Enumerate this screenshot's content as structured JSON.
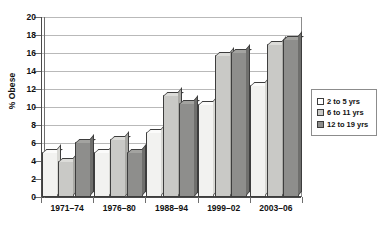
{
  "chart_data": {
    "type": "bar",
    "title": "",
    "xlabel": "",
    "ylabel": "% Obese",
    "ylim": [
      0,
      20
    ],
    "ytick_step": 2,
    "yticks": [
      "20",
      "18",
      "16",
      "14",
      "12",
      "10",
      "8",
      "6",
      "4",
      "2",
      "0"
    ],
    "grid": true,
    "legend_position": "right",
    "categories": [
      "1971–74",
      "1976–80",
      "1988–94",
      "1999–02",
      "2003–06"
    ],
    "series": [
      {
        "name": "2 to 5 yrs",
        "color": "#f2f2f0",
        "values": [
          5.0,
          5.0,
          7.2,
          10.3,
          12.4
        ]
      },
      {
        "name": "6 to 11 yrs",
        "color": "#c9c9c6",
        "values": [
          4.0,
          6.5,
          11.3,
          15.8,
          17.0
        ]
      },
      {
        "name": "12 to 19 yrs",
        "color": "#8e8e8c",
        "values": [
          6.1,
          5.0,
          10.5,
          16.1,
          17.6
        ]
      }
    ]
  },
  "legend": {
    "items": [
      {
        "label": "2 to 5 yrs"
      },
      {
        "label": "6 to 11 yrs"
      },
      {
        "label": "12 to 19 yrs"
      }
    ]
  }
}
